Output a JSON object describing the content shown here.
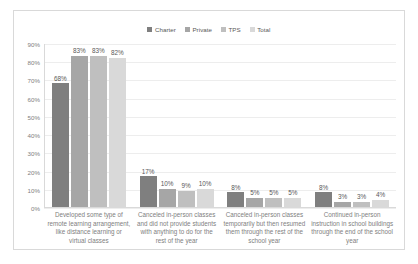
{
  "chart_data": {
    "type": "bar",
    "title": "",
    "subtitle": "",
    "xlabel": "",
    "ylabel": "",
    "ylim": [
      0,
      90
    ],
    "y_ticks": [
      "0%",
      "10%",
      "20%",
      "30%",
      "40%",
      "50%",
      "60%",
      "70%",
      "80%",
      "90%"
    ],
    "y_tick_values": [
      0,
      10,
      20,
      30,
      40,
      50,
      60,
      70,
      80,
      90
    ],
    "grid": true,
    "legend_position": "top-center",
    "orientation": "vertical",
    "categories": [
      "Developed some type of remote learning arrangement, like distance learning or virtual classes",
      "Canceled in-person classes and did not provide students with anything to do for the rest of the year",
      "Canceled in-person classes temporarily but then resumed them through the rest of the school year",
      "Continued in-person instruction in school buildings through the end of the school year"
    ],
    "series": [
      {
        "name": "Charter",
        "color": "#7f7f7f",
        "values": [
          68,
          17,
          8,
          8
        ],
        "labels": [
          "68%",
          "17%",
          "8%",
          "8%"
        ]
      },
      {
        "name": "Private",
        "color": "#a6a6a6",
        "values": [
          83,
          10,
          5,
          3
        ],
        "labels": [
          "83%",
          "10%",
          "5%",
          "3%"
        ]
      },
      {
        "name": "TPS",
        "color": "#bfbfbf",
        "values": [
          83,
          9,
          5,
          3
        ],
        "labels": [
          "83%",
          "9%",
          "5%",
          "3%"
        ]
      },
      {
        "name": "Total",
        "color": "#d9d9d9",
        "values": [
          82,
          10,
          5,
          4
        ],
        "labels": [
          "82%",
          "10%",
          "5%",
          "4%"
        ]
      }
    ]
  }
}
